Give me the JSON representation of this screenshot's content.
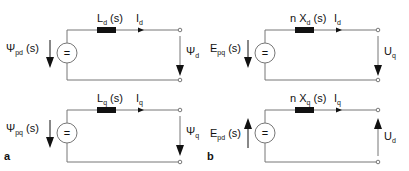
{
  "diagram": {
    "panels": [
      {
        "label": "a",
        "circuits": [
          {
            "axis": "d",
            "source": {
              "symbol": "=",
              "label_main": "Ψ",
              "label_sub": "pd",
              "label_suffix": " (s)",
              "arrow": "down"
            },
            "impedance": {
              "label_main": "L",
              "label_sub": "d",
              "label_suffix": " (s)"
            },
            "current": {
              "label_main": "I",
              "label_sub": "d"
            },
            "output": {
              "label_main": "Ψ",
              "label_sub": "d",
              "arrow": "down"
            }
          },
          {
            "axis": "q",
            "source": {
              "symbol": "=",
              "label_main": "Ψ",
              "label_sub": "pq",
              "label_suffix": " (s)",
              "arrow": "down"
            },
            "impedance": {
              "label_main": "L",
              "label_sub": "q",
              "label_suffix": " (s)"
            },
            "current": {
              "label_main": "I",
              "label_sub": "q"
            },
            "output": {
              "label_main": "Ψ",
              "label_sub": "q",
              "arrow": "down"
            }
          }
        ]
      },
      {
        "label": "b",
        "circuits": [
          {
            "axis": "d",
            "source": {
              "symbol": "=",
              "label_main": "E",
              "label_sub": "pq",
              "label_suffix": " (s)",
              "arrow": "down"
            },
            "impedance": {
              "label_main": "n X",
              "label_sub": "d",
              "label_suffix": " (s)"
            },
            "current": {
              "label_main": "I",
              "label_sub": "d"
            },
            "output": {
              "label_main": "U",
              "label_sub": "q",
              "arrow": "down"
            }
          },
          {
            "axis": "q",
            "source": {
              "symbol": "=",
              "label_main": "E",
              "label_sub": "pd",
              "label_suffix": " (s)",
              "arrow": "up"
            },
            "impedance": {
              "label_main": "n X",
              "label_sub": "q",
              "label_suffix": " (s)"
            },
            "current": {
              "label_main": "I",
              "label_sub": "q"
            },
            "output": {
              "label_main": "U",
              "label_sub": "d",
              "arrow": "up"
            }
          }
        ]
      }
    ]
  }
}
